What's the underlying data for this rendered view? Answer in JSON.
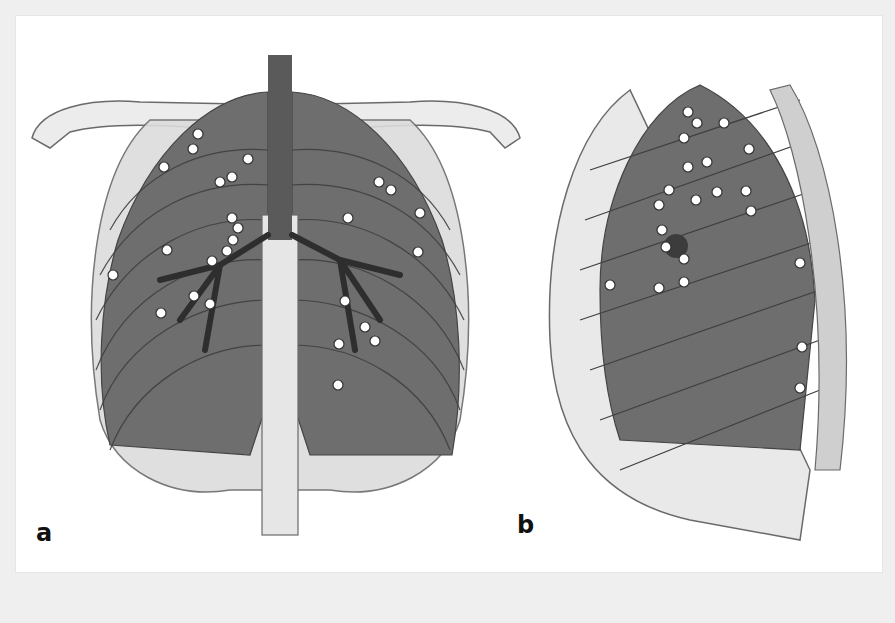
{
  "figure": {
    "panels": [
      {
        "id": "a",
        "label": "a",
        "view": "frontal chest"
      },
      {
        "id": "b",
        "label": "b",
        "view": "lateral chest"
      }
    ],
    "colors": {
      "background": "#efefef",
      "card": "#ffffff",
      "bone_fill": "#e8e8e8",
      "bone_stroke": "#6a6a6a",
      "lung_fill": "#6e6e6e",
      "lung_dark": "#3c3c3c",
      "rib_band": "#4f4f4f",
      "trachea": "#5a5a5a",
      "dot_fill": "#ffffff",
      "dot_stroke": "#333333"
    },
    "dots_a": [
      [
        198,
        134
      ],
      [
        193,
        149
      ],
      [
        164,
        167
      ],
      [
        248,
        159
      ],
      [
        232,
        177
      ],
      [
        220,
        182
      ],
      [
        232,
        218
      ],
      [
        238,
        228
      ],
      [
        233,
        240
      ],
      [
        227,
        251
      ],
      [
        212,
        261
      ],
      [
        167,
        250
      ],
      [
        113,
        275
      ],
      [
        194,
        296
      ],
      [
        210,
        304
      ],
      [
        161,
        313
      ],
      [
        379,
        182
      ],
      [
        391,
        190
      ],
      [
        420,
        213
      ],
      [
        348,
        218
      ],
      [
        418,
        252
      ],
      [
        345,
        301
      ],
      [
        365,
        327
      ],
      [
        375,
        341
      ],
      [
        339,
        344
      ],
      [
        338,
        385
      ]
    ],
    "dots_b": [
      [
        688,
        112
      ],
      [
        697,
        123
      ],
      [
        724,
        123
      ],
      [
        684,
        138
      ],
      [
        749,
        149
      ],
      [
        688,
        167
      ],
      [
        707,
        162
      ],
      [
        669,
        190
      ],
      [
        659,
        205
      ],
      [
        696,
        200
      ],
      [
        717,
        192
      ],
      [
        746,
        191
      ],
      [
        751,
        211
      ],
      [
        662,
        230
      ],
      [
        666,
        247
      ],
      [
        684,
        259
      ],
      [
        610,
        285
      ],
      [
        659,
        288
      ],
      [
        684,
        282
      ],
      [
        800,
        263
      ],
      [
        802,
        347
      ],
      [
        800,
        388
      ]
    ]
  }
}
